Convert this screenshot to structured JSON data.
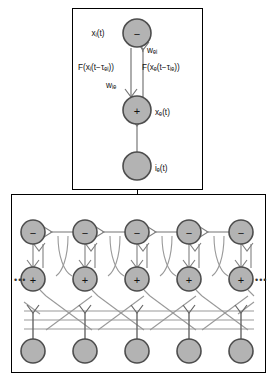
{
  "figure": {
    "background": "#ffffff",
    "node_fill": "#b3b3b3",
    "node_stroke": "#4d4d4d",
    "line_color": "#808080",
    "dark_line_color": "#555555",
    "panel_stroke": "#000000"
  },
  "top_panel": {
    "name": "single-unit-schematic",
    "nodes": [
      {
        "id": "inhibitory",
        "symbol": "−",
        "label": "xᵢ(t)"
      },
      {
        "id": "excitatory",
        "symbol": "+",
        "label": "xₑ(t)"
      },
      {
        "id": "input",
        "symbol": "",
        "label": "iₑ(t)"
      }
    ],
    "edge_labels": {
      "left_delay": "F(xᵢ(t−τₑᵢ))",
      "right_delay": "F(xₑ(t−τᵢₑ))",
      "weight_right": "wₑᵢ",
      "weight_left": "wᵢₑ"
    }
  },
  "bottom_panel": {
    "name": "network-array-schematic",
    "columns": 5,
    "row_symbols": {
      "inhibitory": "−",
      "excitatory": "+",
      "input": ""
    },
    "ellipsis_left": "•••",
    "ellipsis_right": "•••"
  }
}
